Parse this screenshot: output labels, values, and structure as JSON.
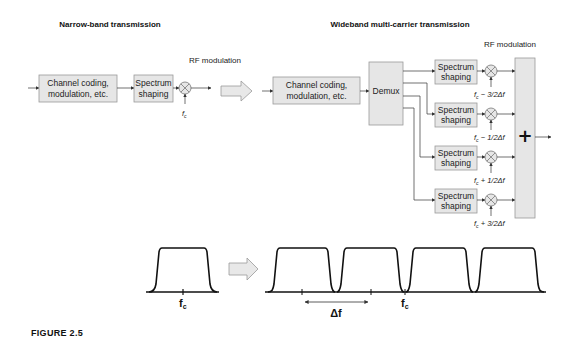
{
  "narrowband": {
    "title": "Narrow-band transmission",
    "rf_label": "RF modulation",
    "channel_box": [
      "Channel coding,",
      "modulation, etc."
    ],
    "spectrum_box": [
      "Spectrum",
      "shaping"
    ],
    "carrier": "f",
    "carrier_sub": "c"
  },
  "wideband": {
    "title": "Wideband multi-carrier transmission",
    "rf_label": "RF modulation",
    "channel_box": [
      "Channel coding,",
      "modulation, etc."
    ],
    "demux_label": "Demux",
    "branches": [
      {
        "spectrum": [
          "Spectrum",
          "shaping"
        ],
        "freq_suffix": " − 3/2Δf"
      },
      {
        "spectrum": [
          "Spectrum",
          "shaping"
        ],
        "freq_suffix": " − 1/2Δf"
      },
      {
        "spectrum": [
          "Spectrum",
          "shaping"
        ],
        "freq_suffix": " + 1/2Δf"
      },
      {
        "spectrum": [
          "Spectrum",
          "shaping"
        ],
        "freq_suffix": " + 3/2Δf"
      }
    ],
    "sum_symbol": "+"
  },
  "spectrum": {
    "narrow_fc": "f",
    "narrow_fc_sub": "c",
    "delta_f": "Δf",
    "wide_fc": "f",
    "wide_fc_sub": "c",
    "num_carriers": 4
  },
  "caption": "FIGURE 2.5"
}
